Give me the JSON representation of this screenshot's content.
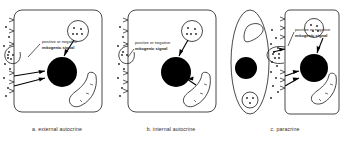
{
  "figure": {
    "panels": [
      {
        "id": "a",
        "caption": "a.  external autocrine",
        "label_line1": "positive or negative",
        "label_line2": "mitogenic signal",
        "cell_shape": "rounded-rectangle",
        "organelles": [
          "nucleus",
          "secretory-vesicle",
          "golgi-crescent",
          "membrane-receptors",
          "ligand-dots",
          "endosome"
        ],
        "arrow_count": 3
      },
      {
        "id": "b",
        "caption": "b.  internal autocrine",
        "label_line1": "positive or negative",
        "label_line2": "mitogenic signal",
        "cell_shape": "rounded-rectangle",
        "organelles": [
          "nucleus",
          "secretory-vesicle",
          "golgi-crescent",
          "membrane-receptors",
          "ligand-dots",
          "endosome"
        ],
        "arrow_count": 2
      },
      {
        "id": "c",
        "caption": "c.   paracrine",
        "label_line1": "positive or negative",
        "label_line2": "mitogenic signal",
        "cell_shape": "oval-signaling-cell + rounded-rectangle-target-cell",
        "organelles": [
          "nucleus",
          "secretory-vesicle",
          "golgi-crescent",
          "membrane-receptors",
          "ligand-dots",
          "endosome"
        ],
        "arrow_count": 3
      }
    ],
    "colors": {
      "outline": "#1a1a1a",
      "nucleus_fill": "#000000",
      "background": "#ffffff",
      "text": "#2b2b2b"
    }
  }
}
